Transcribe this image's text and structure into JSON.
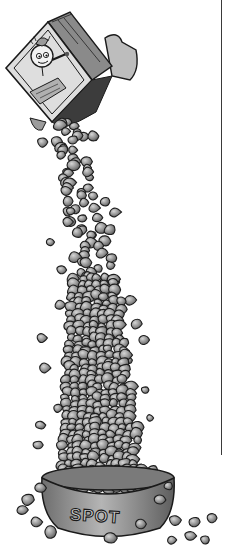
{
  "illustration": {
    "description": "Pen-and-ink cartoon of a dog food box pouring kibble into a towering pile in a dog bowl",
    "bowl_label": "SPOT",
    "box": {
      "mascot": "cartoon-dog-face",
      "orientation": "tipped-over"
    },
    "colors": {
      "background": "#ffffff",
      "ink": "#1a1a1a",
      "kibble_fill": "#8c8c8c",
      "kibble_highlight": "#c8c8c8",
      "box_fill": "#d9d9d9",
      "rule_line": "#3a3a3a"
    }
  }
}
